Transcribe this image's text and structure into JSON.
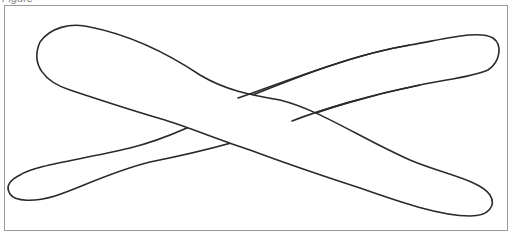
{
  "figure": {
    "caption": "Figure",
    "frame_border_color": "#9a9a9a",
    "stroke_color": "#2a2a2a",
    "background_color": "#ffffff"
  }
}
